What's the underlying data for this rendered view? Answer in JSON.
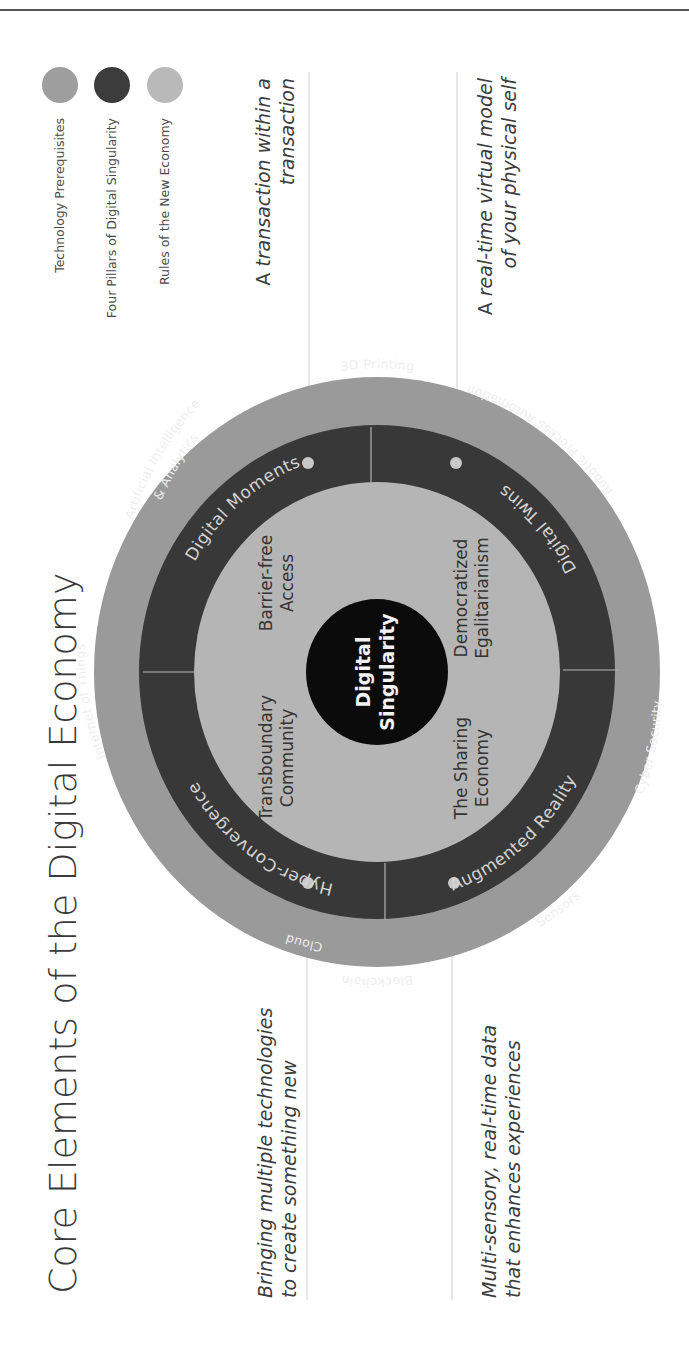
{
  "slide": {
    "title": "Core Elements of the Digital Economy"
  },
  "legend": {
    "items": [
      {
        "label": "Technology Prerequisites",
        "color": "#9e9e9e"
      },
      {
        "label": "Four Pillars of Digital Singularity",
        "color": "#3c3c3c"
      },
      {
        "label": "Rules of the New Economy",
        "color": "#b9b9b9"
      }
    ]
  },
  "colors": {
    "technology_ring": "#9a9a9a",
    "pillar_ring": "#383838",
    "rules_disc": "#b5b5b5",
    "core": "#0b0b0b",
    "leader_line": "#cfcfcf",
    "top_rule": "#555555"
  },
  "diagram": {
    "core": {
      "line1": "Digital",
      "line2": "Singularity"
    },
    "technology_prerequisites": [
      "Internet of Things",
      "Artificial Intelligence",
      "& Analytics",
      "3D Printing",
      "Robotic Process Automation",
      "Cyber Security",
      "Sensors",
      "Blockchain",
      "Cloud"
    ],
    "pillars": [
      {
        "label": "Hyper-Convergence",
        "description": [
          "Bringing multiple technologies",
          "to create something new"
        ]
      },
      {
        "label": "Digital Moments",
        "description_prefix": "A ",
        "description": [
          "transaction within a",
          "transaction"
        ]
      },
      {
        "label": "Digital Twins",
        "description_prefix": "A ",
        "description": [
          "real-time virtual model",
          "of your physical self"
        ]
      },
      {
        "label": "Augmented Reality",
        "description": [
          "Multi-sensory, real-time data",
          "that enhances experiences"
        ]
      }
    ],
    "rules": [
      {
        "line1": "Transboundary",
        "line2": "Community"
      },
      {
        "line1": "Barrier-free",
        "line2": "Access"
      },
      {
        "line1": "Democratized",
        "line2": "Egalitarianism"
      },
      {
        "line1": "The Sharing",
        "line2": "Economy"
      }
    ]
  }
}
